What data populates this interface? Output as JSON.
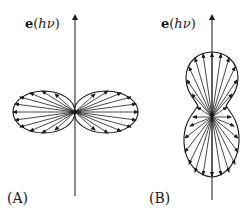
{
  "figure": {
    "panels": [
      {
        "id": "A",
        "label": "(A)",
        "axis_label": {
          "vector": "e",
          "open": "(",
          "h": "h",
          "nu": "ν",
          "close": ")"
        },
        "shape": "horizontal dumbbell (figure-eight) lobes perpendicular to polarization vector",
        "ray_count_per_lobe": 9
      },
      {
        "id": "B",
        "label": "(B)",
        "axis_label": {
          "vector": "e",
          "open": "(",
          "h": "h",
          "nu": "ν",
          "close": ")"
        },
        "shape": "vertical peanut lobes along polarization vector",
        "ray_count_per_lobe": 11
      }
    ],
    "colors": {
      "ink": "#1a1a1a",
      "background": "#ffffff"
    }
  }
}
